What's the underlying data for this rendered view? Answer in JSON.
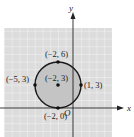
{
  "figure": {
    "type": "circle-on-coordinate-plane",
    "axes": {
      "x_label": "x",
      "y_label": "y",
      "origin_label": "O"
    },
    "circle": {
      "center": [
        -2,
        3
      ],
      "radius": 3,
      "fill": "#c8c8c8",
      "stroke": "#1a1a1a"
    },
    "points": [
      {
        "label": "(−2, 6)",
        "x": -2,
        "y": 6
      },
      {
        "label": "(−5, 3)",
        "x": -5,
        "y": 3
      },
      {
        "label": "(−2, 3)",
        "x": -2,
        "y": 3
      },
      {
        "label": "(1, 3)",
        "x": 1,
        "y": 3
      },
      {
        "label": "(−2, 0)",
        "x": -2,
        "y": 0
      }
    ],
    "colors": {
      "grid_bg": "#dcdcdc",
      "grid_line": "#f4f4f4",
      "axis": "#222222"
    }
  }
}
